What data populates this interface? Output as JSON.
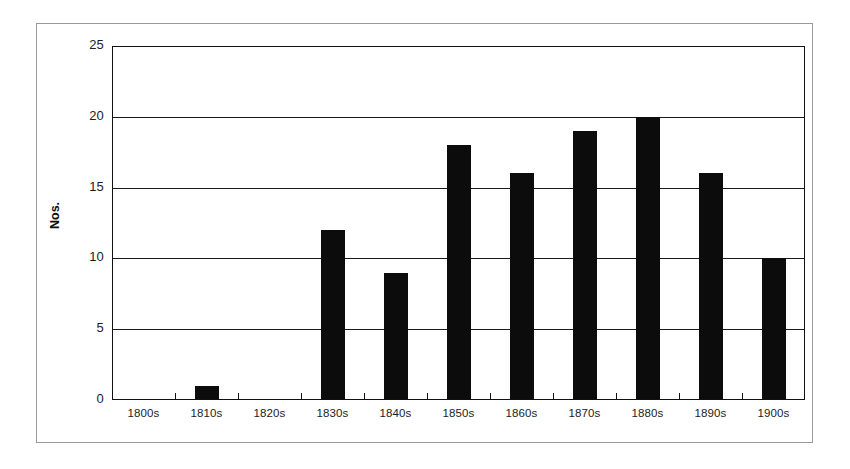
{
  "chart_data": {
    "type": "bar",
    "title": "",
    "subtitle": "",
    "xlabel": "",
    "ylabel": "Nos.",
    "categories": [
      "1800s",
      "1810s",
      "1820s",
      "1830s",
      "1840s",
      "1850s",
      "1860s",
      "1870s",
      "1880s",
      "1890s",
      "1900s"
    ],
    "values": [
      0,
      1,
      0,
      12,
      9,
      18,
      16,
      19,
      20,
      16,
      10
    ],
    "series": [
      {
        "name": "Nos.",
        "values": [
          0,
          1,
          0,
          12,
          9,
          18,
          16,
          19,
          20,
          16,
          10
        ]
      }
    ],
    "ylim": [
      0,
      25
    ],
    "ytick_labels": [
      "25",
      "20",
      "15",
      "10",
      "5",
      "0"
    ],
    "ytick_values": [
      25,
      20,
      15,
      10,
      5,
      0
    ],
    "grid": "horizontal",
    "legend": "none",
    "bar_color": "#0c0c0c",
    "grid_color": "#1a1a1a",
    "axis_color": "#111111",
    "frame_color": "#9a9a9a",
    "background_color": "#ffffff"
  }
}
